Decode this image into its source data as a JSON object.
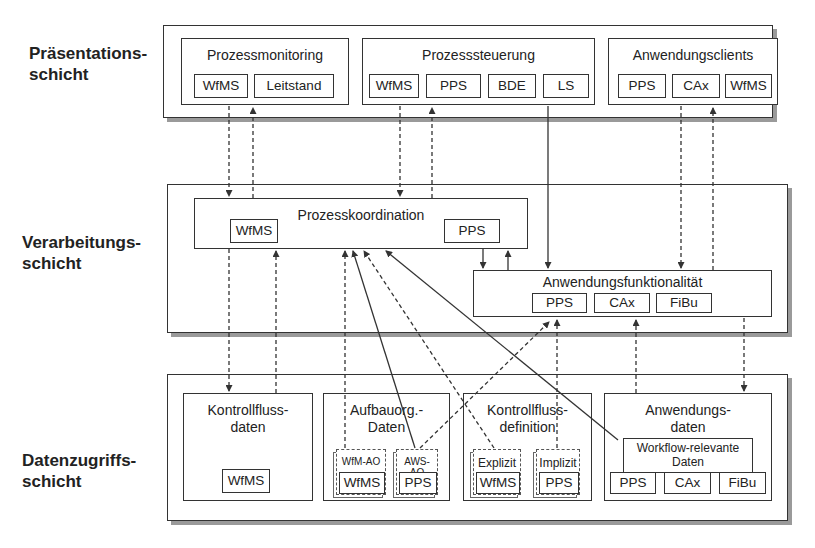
{
  "layers": {
    "presentation": {
      "label": "Präsentations-\nschicht"
    },
    "processing": {
      "label": "Verarbeitungs-\nschicht"
    },
    "data_access": {
      "label": "Datenzugriffs-\nschicht"
    }
  },
  "presentation": {
    "prozessmonitoring": {
      "title": "Prozessmonitoring",
      "items": [
        "WfMS",
        "Leitstand"
      ]
    },
    "prozesssteuerung": {
      "title": "Prozesssteuerung",
      "items": [
        "WfMS",
        "PPS",
        "BDE",
        "LS"
      ]
    },
    "anwendungsclients": {
      "title": "Anwendungsclients",
      "items": [
        "PPS",
        "CAx",
        "WfMS"
      ]
    }
  },
  "processing": {
    "prozesskoordination": {
      "title": "Prozesskoordination",
      "items": [
        "WfMS",
        "PPS"
      ]
    },
    "anwendungsfunktionalitaet": {
      "title": "Anwendungsfunktionalität",
      "items": [
        "PPS",
        "CAx",
        "FiBu"
      ]
    }
  },
  "data_access": {
    "kontrollflussdaten": {
      "title": "Kontrollfluss-\ndaten",
      "items": [
        "WfMS"
      ]
    },
    "aufbauorg": {
      "title": "Aufbauorg.-\nDaten",
      "subs": [
        {
          "label": "WfM-AO",
          "item": "WfMS"
        },
        {
          "label": "AWS-AO",
          "item": "PPS"
        }
      ]
    },
    "kontrollflussdefinition": {
      "title": "Kontrollfluss-\ndefinition",
      "subs": [
        {
          "label": "Explizit",
          "item": "WfMS"
        },
        {
          "label": "Implizit",
          "item": "PPS"
        }
      ]
    },
    "anwendungsdaten": {
      "title": "Anwendungs-\ndaten",
      "sub_title": "Workflow-relevante\nDaten",
      "items": [
        "PPS",
        "CAx",
        "FiBu"
      ]
    }
  },
  "colors": {
    "line": "#333333",
    "shadow": "#9a9a9a",
    "background": "#ffffff"
  }
}
